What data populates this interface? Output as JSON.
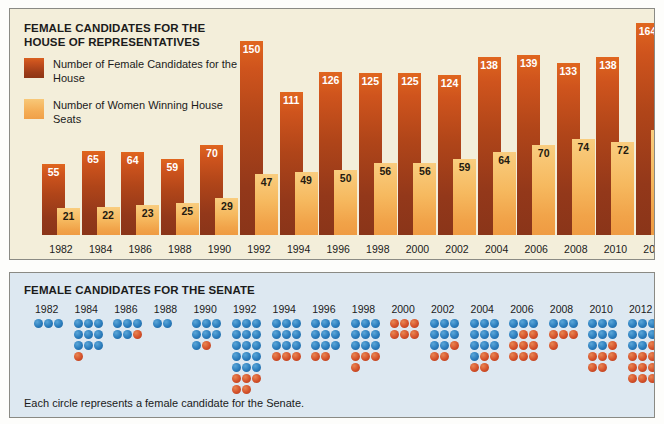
{
  "house": {
    "title": "FEMALE CANDIDATES FOR THE HOUSE OF REPRESENTATIVES",
    "legend": [
      {
        "key": "candidates",
        "label": "Number of Female Candidates for the House",
        "color": "#b0451a"
      },
      {
        "key": "winners",
        "label": "Number of Women Winning House Seats",
        "color": "#f4ae56"
      }
    ]
  },
  "senate": {
    "title": "FEMALE CANDIDATES FOR THE SENATE",
    "caption": "Each circle represents a female candidate for the Senate.",
    "colors": {
      "democrat_blue": "#2a7cbc",
      "republican_red": "#d4512a"
    }
  },
  "chart_data": [
    {
      "type": "bar",
      "title": "FEMALE CANDIDATES FOR THE HOUSE OF REPRESENTATIVES",
      "xlabel": "",
      "ylabel": "",
      "categories": [
        "1982",
        "1984",
        "1986",
        "1988",
        "1990",
        "1992",
        "1994",
        "1996",
        "1998",
        "2000",
        "2002",
        "2004",
        "2006",
        "2008",
        "2010",
        "2012"
      ],
      "series": [
        {
          "name": "Number of Female Candidates for the House",
          "color": "#b0451a",
          "values": [
            55,
            65,
            64,
            59,
            70,
            150,
            111,
            126,
            125,
            125,
            124,
            138,
            139,
            133,
            138,
            164
          ]
        },
        {
          "name": "Number of Women Winning House Seats",
          "color": "#f4ae56",
          "values": [
            21,
            22,
            23,
            25,
            29,
            47,
            49,
            50,
            56,
            56,
            59,
            64,
            70,
            74,
            72,
            81
          ]
        }
      ],
      "ylim": [
        0,
        164
      ],
      "grid": false,
      "legend_position": "top-left"
    },
    {
      "type": "table",
      "title": "FEMALE CANDIDATES FOR THE SENATE",
      "caption": "Each circle represents a female candidate for the Senate.",
      "note": "Each column is one election year; each circle is one candidate. Blue circles and red circles are drawn as separate groups within a column.",
      "categories": [
        "1982",
        "1984",
        "1986",
        "1988",
        "1990",
        "1992",
        "1994",
        "1996",
        "1998",
        "2000",
        "2002",
        "2004",
        "2006",
        "2008",
        "2010",
        "2012"
      ],
      "series": [
        {
          "name": "blue circles",
          "color": "#2a7cbc",
          "values": [
            3,
            9,
            5,
            2,
            7,
            15,
            9,
            9,
            9,
            0,
            8,
            10,
            4,
            3,
            8,
            8
          ]
        },
        {
          "name": "red circles",
          "color": "#d4512a",
          "values": [
            0,
            1,
            1,
            0,
            1,
            5,
            3,
            2,
            4,
            6,
            3,
            4,
            8,
            4,
            6,
            10
          ]
        }
      ],
      "totals": [
        3,
        10,
        6,
        2,
        8,
        20,
        12,
        11,
        13,
        6,
        11,
        14,
        12,
        7,
        14,
        18
      ]
    }
  ]
}
